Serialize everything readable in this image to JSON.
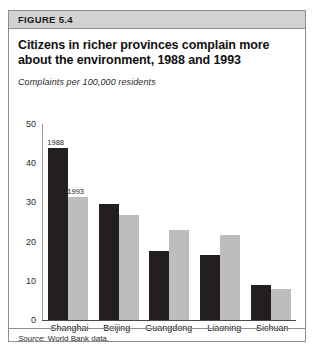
{
  "figure": {
    "header_label": "FIGURE 5.4",
    "title": "Citizens in richer provinces complain more about the environment, 1988 and 1993",
    "subtitle": "Complaints per 100,000 residents",
    "source_label": "Source:",
    "source_text": "World Bank data."
  },
  "chart_data": {
    "type": "bar",
    "title": "Citizens in richer provinces complain more about the environment, 1988 and 1993",
    "subtitle": "Complaints per 100,000 residents",
    "xlabel": "",
    "ylabel": "Complaints per 100,000 residents",
    "ylim": [
      0,
      50
    ],
    "yticks": [
      0,
      10,
      20,
      30,
      40,
      50
    ],
    "grid": false,
    "legend_position": "inline-annotation",
    "categories": [
      "Shanghai",
      "Beijing",
      "Guangdong",
      "Liaoning",
      "Sichuan"
    ],
    "series": [
      {
        "name": "1988",
        "color": "#231f20",
        "values": [
          43.8,
          29.7,
          17.5,
          16.5,
          9.0
        ]
      },
      {
        "name": "1993",
        "color": "#bdbdbd",
        "values": [
          31.3,
          26.9,
          23.0,
          21.8,
          8.0
        ]
      }
    ],
    "annotations": [
      {
        "text": "1988",
        "series": "1988",
        "category": "Shanghai"
      },
      {
        "text": "1993",
        "series": "1993",
        "category": "Shanghai"
      }
    ]
  }
}
